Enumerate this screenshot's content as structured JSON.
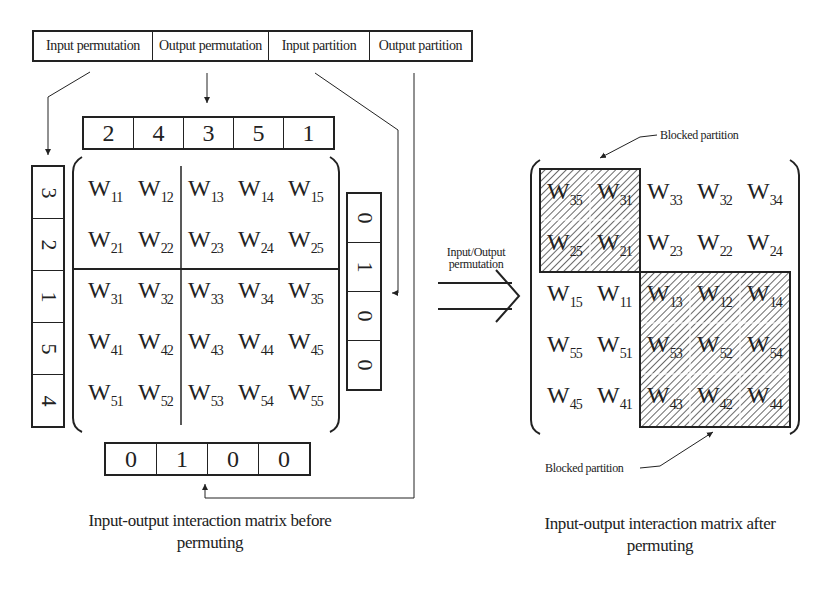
{
  "header_boxes": [
    {
      "label": "Input permutation",
      "width": 118
    },
    {
      "label": "Output permutation",
      "width": 115
    },
    {
      "label": "Input partition",
      "width": 100
    },
    {
      "label": "Output partition",
      "width": 101
    }
  ],
  "output_permutation_vector": [
    "2",
    "4",
    "3",
    "5",
    "1"
  ],
  "input_permutation_vector": [
    "3",
    "2",
    "1",
    "5",
    "4"
  ],
  "output_partition_vector": [
    "0",
    "1",
    "0",
    "0"
  ],
  "input_partition_vector": [
    "0",
    "1",
    "0",
    "0"
  ],
  "matrix_before": [
    [
      {
        "b": "W",
        "s": "11"
      },
      {
        "b": "W",
        "s": "12"
      },
      {
        "b": "W",
        "s": "13"
      },
      {
        "b": "W",
        "s": "14"
      },
      {
        "b": "W",
        "s": "15"
      }
    ],
    [
      {
        "b": "W",
        "s": "21"
      },
      {
        "b": "W",
        "s": "22"
      },
      {
        "b": "W",
        "s": "23"
      },
      {
        "b": "W",
        "s": "24"
      },
      {
        "b": "W",
        "s": "25"
      }
    ],
    [
      {
        "b": "W",
        "s": "31"
      },
      {
        "b": "W",
        "s": "32"
      },
      {
        "b": "W",
        "s": "33"
      },
      {
        "b": "W",
        "s": "34"
      },
      {
        "b": "W",
        "s": "35"
      }
    ],
    [
      {
        "b": "W",
        "s": "41"
      },
      {
        "b": "W",
        "s": "42"
      },
      {
        "b": "W",
        "s": "43"
      },
      {
        "b": "W",
        "s": "44"
      },
      {
        "b": "W",
        "s": "45"
      }
    ],
    [
      {
        "b": "W",
        "s": "51"
      },
      {
        "b": "W",
        "s": "52"
      },
      {
        "b": "W",
        "s": "53"
      },
      {
        "b": "W",
        "s": "54"
      },
      {
        "b": "W",
        "s": "55"
      }
    ]
  ],
  "matrix_after": [
    [
      {
        "b": "W",
        "s": "35"
      },
      {
        "b": "W",
        "s": "31"
      },
      {
        "b": "W",
        "s": "33"
      },
      {
        "b": "W",
        "s": "32"
      },
      {
        "b": "W",
        "s": "34"
      }
    ],
    [
      {
        "b": "W",
        "s": "25"
      },
      {
        "b": "W",
        "s": "21"
      },
      {
        "b": "W",
        "s": "23"
      },
      {
        "b": "W",
        "s": "22"
      },
      {
        "b": "W",
        "s": "24"
      }
    ],
    [
      {
        "b": "W",
        "s": "15"
      },
      {
        "b": "W",
        "s": "11"
      },
      {
        "b": "W",
        "s": "13"
      },
      {
        "b": "W",
        "s": "12"
      },
      {
        "b": "W",
        "s": "14"
      }
    ],
    [
      {
        "b": "W",
        "s": "55"
      },
      {
        "b": "W",
        "s": "51"
      },
      {
        "b": "W",
        "s": "53"
      },
      {
        "b": "W",
        "s": "52"
      },
      {
        "b": "W",
        "s": "54"
      }
    ],
    [
      {
        "b": "W",
        "s": "45"
      },
      {
        "b": "W",
        "s": "41"
      },
      {
        "b": "W",
        "s": "43"
      },
      {
        "b": "W",
        "s": "42"
      },
      {
        "b": "W",
        "s": "44"
      }
    ]
  ],
  "arrow_label": [
    "Input/Output",
    "permutation"
  ],
  "blocked_partition_top": "Blocked partition",
  "blocked_partition_bottom": "Blocked partition",
  "caption_before": [
    "Input-output interaction matrix before",
    "permuting"
  ],
  "caption_after": [
    "Input-output interaction matrix after",
    "permuting"
  ],
  "colors": {
    "ink": "#222222",
    "background": "#ffffff",
    "hatch": "#444444"
  }
}
